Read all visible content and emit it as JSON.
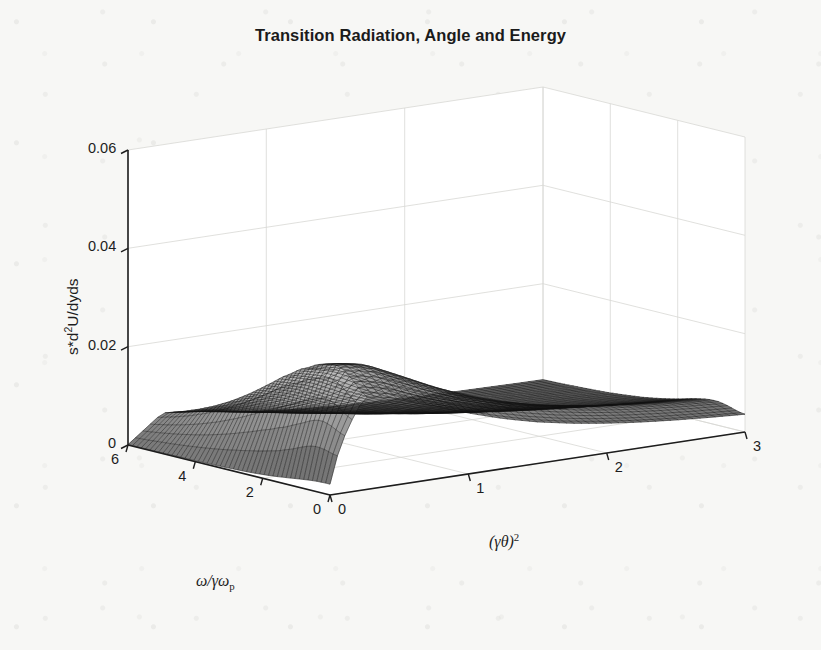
{
  "figure": {
    "title": "Transition Radiation, Angle and Energy",
    "background_color": "#f7f7f5",
    "line_color": "#1d1d1d",
    "grid_color": "#d8d8d4"
  },
  "axes": {
    "x_axis": {
      "name": "gamma-theta-squared-axis",
      "label_parts": {
        "open": "(",
        "gamma": "γ",
        "theta": "θ",
        "close": ")",
        "exponent": "2"
      },
      "label_plain": "(γθ)²",
      "ticks": [
        "0",
        "1",
        "2",
        "3"
      ],
      "tick_values": [
        0,
        1,
        2,
        3
      ],
      "range": [
        0,
        3
      ]
    },
    "y_axis": {
      "name": "omega-over-gamma-omega-p-axis",
      "label_parts": {
        "omega": "ω",
        "slash": "/",
        "gamma": "γ",
        "omega2": "ω",
        "sub": "p"
      },
      "label_plain": "ω/γωp",
      "ticks": [
        "0",
        "2",
        "4",
        "6"
      ],
      "tick_values": [
        0,
        2,
        4,
        6
      ],
      "range": [
        0,
        6
      ]
    },
    "z_axis": {
      "name": "intensity-axis",
      "label_plain": "s*d²U/dyds",
      "label_parts": {
        "pre": "s*d",
        "sup": "2",
        "post": "U/dyds"
      },
      "ticks": [
        "0",
        "0.02",
        "0.04",
        "0.06"
      ],
      "tick_values": [
        0,
        0.02,
        0.04,
        0.06
      ],
      "range": [
        0,
        0.06
      ]
    }
  },
  "chart_data": {
    "type": "surface",
    "title": "Transition Radiation, Angle and Energy",
    "xlabel": "(γθ)²",
    "ylabel": "ω/γωp",
    "zlabel": "s*d²U/dyds",
    "xlim": [
      0,
      3
    ],
    "ylim": [
      0,
      6
    ],
    "zlim": [
      0,
      0.06
    ],
    "grid": true,
    "legend": null,
    "colormap": "gray",
    "shading": "mesh-gray",
    "view": {
      "azimuth": -37.5,
      "elevation": 30
    },
    "x": [
      0,
      0.25,
      0.5,
      0.75,
      1,
      1.25,
      1.5,
      1.75,
      2,
      2.25,
      2.5,
      2.75,
      3
    ],
    "y": [
      0,
      0.5,
      1,
      1.5,
      2,
      2.5,
      3,
      3.5,
      4,
      4.5,
      5,
      5.5,
      6
    ],
    "z_note": "s*d2U/dyds for transition radiation; sharp ridge near (gamma*theta)^2 ~ 0.3 at small omega/(gamma*omega_p), decaying to near zero for large (gamma*theta)^2; peak value ~0.045",
    "z_peak_value": 0.045,
    "z_peak_location": {
      "x": 0.3,
      "y": 1.2
    },
    "z": [
      [
        0.0,
        0.0255,
        0.024,
        0.0205,
        0.0165,
        0.013,
        0.0102,
        0.0081,
        0.0065,
        0.0053,
        0.0044,
        0.0037,
        0.0031
      ],
      [
        0.0,
        0.03,
        0.0282,
        0.0238,
        0.019,
        0.0148,
        0.0115,
        0.0091,
        0.0073,
        0.0059,
        0.0049,
        0.0041,
        0.0035
      ],
      [
        0.0,
        0.0372,
        0.0344,
        0.0283,
        0.0221,
        0.017,
        0.0131,
        0.0102,
        0.0081,
        0.0066,
        0.0054,
        0.0045,
        0.0038
      ],
      [
        0.0,
        0.0432,
        0.0392,
        0.0313,
        0.0239,
        0.0181,
        0.0138,
        0.0107,
        0.0085,
        0.0068,
        0.0056,
        0.0047,
        0.004
      ],
      [
        0.0,
        0.0447,
        0.0398,
        0.0311,
        0.0234,
        0.0175,
        0.0133,
        0.0103,
        0.0081,
        0.0066,
        0.0054,
        0.0045,
        0.0038
      ],
      [
        0.0,
        0.0421,
        0.0368,
        0.0284,
        0.0212,
        0.0158,
        0.012,
        0.0093,
        0.0074,
        0.006,
        0.0049,
        0.0041,
        0.0035
      ],
      [
        0.0,
        0.0372,
        0.0322,
        0.0247,
        0.0184,
        0.0137,
        0.0104,
        0.0081,
        0.0064,
        0.0052,
        0.0043,
        0.0036,
        0.003
      ],
      [
        0.0,
        0.0318,
        0.0273,
        0.0209,
        0.0155,
        0.0116,
        0.0088,
        0.0068,
        0.0054,
        0.0044,
        0.0036,
        0.003,
        0.0026
      ],
      [
        0.0,
        0.0268,
        0.0229,
        0.0175,
        0.013,
        0.0097,
        0.0074,
        0.0057,
        0.0045,
        0.0037,
        0.003,
        0.0025,
        0.0021
      ],
      [
        0.0,
        0.0224,
        0.0191,
        0.0146,
        0.0108,
        0.0081,
        0.0061,
        0.0048,
        0.0038,
        0.0031,
        0.0025,
        0.0021,
        0.0018
      ],
      [
        0.0,
        0.0187,
        0.0159,
        0.0121,
        0.009,
        0.0067,
        0.0051,
        0.004,
        0.0031,
        0.0025,
        0.0021,
        0.0017,
        0.0015
      ],
      [
        0.0,
        0.0156,
        0.0133,
        0.0101,
        0.0075,
        0.0056,
        0.0043,
        0.0033,
        0.0026,
        0.0021,
        0.0017,
        0.0014,
        0.0012
      ],
      [
        0.0,
        0.013,
        0.0111,
        0.0084,
        0.0063,
        0.0047,
        0.0035,
        0.0027,
        0.0022,
        0.0018,
        0.0015,
        0.0012,
        0.001
      ]
    ]
  }
}
